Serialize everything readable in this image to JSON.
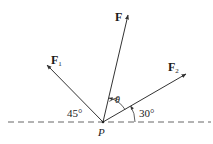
{
  "diagram": {
    "type": "force-vector-diagram",
    "point": {
      "label": "P"
    },
    "vectors": [
      {
        "id": "F",
        "label": "F",
        "subscript": ""
      },
      {
        "id": "F1",
        "label": "F",
        "subscript": "1"
      },
      {
        "id": "F2",
        "label": "F",
        "subscript": "2"
      }
    ],
    "angles": {
      "theta": "θ",
      "left_angle": "45°",
      "right_angle": "30°"
    },
    "colors": {
      "line": "#333333",
      "dashed": "#555555",
      "text": "#1a1a1a"
    }
  }
}
